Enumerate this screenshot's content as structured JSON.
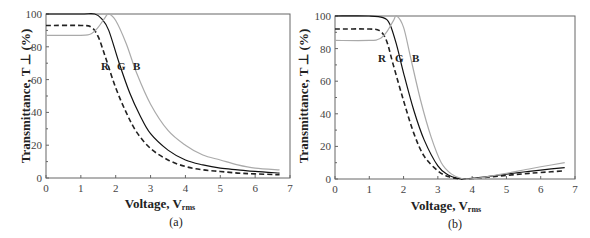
{
  "chart_data": [
    {
      "type": "line",
      "panel": "(a)",
      "xlabel": "Voltage, V",
      "xlabel_sub": "rms",
      "ylabel": "Transmittance, T ⊥ (%)",
      "xlim": [
        0,
        7
      ],
      "ylim": [
        0,
        100
      ],
      "xticks": [
        "0",
        "1",
        "2",
        "3",
        "4",
        "5",
        "6",
        "7"
      ],
      "yticks": [
        "0",
        "20",
        "40",
        "60",
        "80",
        "100"
      ],
      "annotations": [
        "R",
        "G",
        "B"
      ],
      "series": [
        {
          "name": "R",
          "style": "dashed",
          "color": "#222222",
          "x": [
            0,
            1,
            1.3,
            1.5,
            1.7,
            2.0,
            2.3,
            2.6,
            3.0,
            3.5,
            4.0,
            4.5,
            5.0,
            5.5,
            6.0,
            6.7
          ],
          "y": [
            93,
            93,
            92,
            86,
            74,
            55,
            40,
            28,
            18,
            11,
            7,
            5,
            4,
            3,
            2.5,
            2
          ]
        },
        {
          "name": "G",
          "style": "solid",
          "color": "#111111",
          "x": [
            0,
            1,
            1.4,
            1.6,
            1.8,
            2.1,
            2.4,
            2.7,
            3.0,
            3.5,
            4.0,
            4.5,
            5.0,
            5.5,
            6.0,
            6.7
          ],
          "y": [
            100,
            100,
            100,
            97,
            90,
            70,
            52,
            38,
            27,
            17,
            11,
            8,
            6,
            5,
            4,
            3
          ]
        },
        {
          "name": "B",
          "style": "solid",
          "color": "#aaaaaa",
          "x": [
            0,
            1,
            1.3,
            1.5,
            1.7,
            1.8,
            2.0,
            2.3,
            2.6,
            3.0,
            3.5,
            4.0,
            4.5,
            5.0,
            5.5,
            6.0,
            6.7
          ],
          "y": [
            87,
            87,
            88,
            92,
            98,
            100,
            96,
            82,
            64,
            45,
            29,
            20,
            14,
            11,
            8,
            6,
            5
          ]
        }
      ]
    },
    {
      "type": "line",
      "panel": "(b)",
      "xlabel": "Voltage, V",
      "xlabel_sub": "rms",
      "ylabel": "Transmittance, T ⊥ (%)",
      "xlim": [
        0,
        7
      ],
      "ylim": [
        0,
        100
      ],
      "xticks": [
        "0",
        "1",
        "2",
        "3",
        "4",
        "5",
        "6",
        "7"
      ],
      "yticks": [
        "0",
        "20",
        "40",
        "60",
        "80",
        "100"
      ],
      "annotations": [
        "R",
        "G",
        "B"
      ],
      "series": [
        {
          "name": "R",
          "style": "dashed",
          "color": "#222222",
          "x": [
            0,
            1,
            1.3,
            1.5,
            1.7,
            2.0,
            2.3,
            2.6,
            3.0,
            3.3,
            3.6,
            3.8,
            4.0,
            4.5,
            5.0,
            5.5,
            6.0,
            6.7
          ],
          "y": [
            92,
            92,
            91,
            85,
            70,
            48,
            28,
            14,
            5,
            1.5,
            0.2,
            0,
            0.3,
            1.2,
            2.2,
            3.2,
            4,
            5
          ]
        },
        {
          "name": "G",
          "style": "solid",
          "color": "#111111",
          "x": [
            0,
            1,
            1.4,
            1.6,
            1.8,
            2.0,
            2.3,
            2.6,
            3.0,
            3.3,
            3.6,
            3.8,
            4.0,
            4.5,
            5.0,
            5.5,
            6.0,
            6.7
          ],
          "y": [
            100,
            100,
            99,
            95,
            82,
            65,
            42,
            24,
            8,
            2.5,
            0.3,
            0,
            0.3,
            1.6,
            3,
            4.3,
            5.5,
            7
          ]
        },
        {
          "name": "B",
          "style": "solid",
          "color": "#aaaaaa",
          "x": [
            0,
            1,
            1.3,
            1.5,
            1.7,
            1.8,
            2.0,
            2.2,
            2.5,
            2.8,
            3.1,
            3.4,
            3.7,
            3.9,
            4.2,
            4.6,
            5.0,
            5.5,
            6.0,
            6.7
          ],
          "y": [
            85,
            85,
            86,
            90,
            97,
            100,
            93,
            75,
            48,
            26,
            10,
            3,
            0.3,
            0,
            0.5,
            2,
            3.5,
            5.5,
            7.5,
            10
          ]
        }
      ]
    }
  ],
  "panels": {
    "a": {
      "caption": "(a)",
      "ylabel": "Transmittance, T ⊥ (%)",
      "xlabel": "Voltage, V",
      "xlabel_sub": "rms",
      "label_R": "R",
      "label_G": "G",
      "label_B": "B"
    },
    "b": {
      "caption": "(b)",
      "ylabel": "Transmittance, T ⊥ (%)",
      "xlabel": "Voltage, V",
      "xlabel_sub": "rms",
      "label_R": "R",
      "label_G": "G",
      "label_B": "B"
    }
  }
}
